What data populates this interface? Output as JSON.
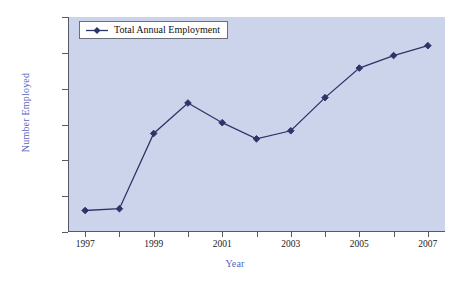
{
  "chart_data": {
    "type": "line",
    "title": "",
    "xlabel": "Year",
    "ylabel": "Number Employed",
    "legend_position": "top-left",
    "grid": false,
    "xlim": [
      1996.5,
      2007.5
    ],
    "ylim": [
      100000,
      220000
    ],
    "ytick_labels": [
      "220,000",
      "200,000",
      "180,000",
      "160,000",
      "140,000",
      "120,000",
      "100,000"
    ],
    "ytick_values": [
      220000,
      200000,
      180000,
      160000,
      140000,
      120000,
      100000
    ],
    "xtick_values": [
      1997,
      1998,
      1999,
      2000,
      2001,
      2002,
      2003,
      2004,
      2005,
      2006,
      2007
    ],
    "xtick_labels": [
      "1997",
      "",
      "1999",
      "",
      "2001",
      "",
      "2003",
      "",
      "2005",
      "",
      "2007"
    ],
    "categories": [
      1997,
      1998,
      1999,
      2000,
      2001,
      2002,
      2003,
      2004,
      2005,
      2006,
      2007
    ],
    "series": [
      {
        "name": "Total Annual Employment",
        "color": "#2e3468",
        "marker": "diamond",
        "values": [
          112000,
          113000,
          155000,
          172000,
          161000,
          152000,
          156500,
          175000,
          191500,
          198500,
          204000
        ]
      }
    ]
  },
  "legend": {
    "label": "Total Annual Employment"
  },
  "colors": {
    "plot_background": "#ccd4ec",
    "series_line": "#2e3468",
    "axis_title": "#5566bb",
    "axis_line": "#555a66",
    "tick_text": "#1a1a1a",
    "legend_background": "#ffffff",
    "legend_border": "#6b6f7d",
    "page_background": "#ffffff"
  }
}
